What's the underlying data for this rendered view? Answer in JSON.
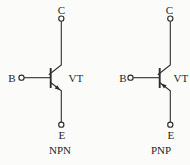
{
  "figure": {
    "description_labels": {
      "collector": "C",
      "base": "B",
      "emitter": "E"
    },
    "background_color": "#fbfbf9",
    "line_color": "#2d2d2d",
    "text_color": "#1f1f1f",
    "transistors": [
      {
        "collector_label": "C",
        "base_label": "B",
        "emitter_label": "E",
        "designator": "VT",
        "type_label": "NPN",
        "emitter_arrow": "outward"
      },
      {
        "collector_label": "C",
        "base_label": "B",
        "emitter_label": "E",
        "designator": "VT",
        "type_label": "PNP",
        "emitter_arrow": "inward"
      }
    ]
  }
}
